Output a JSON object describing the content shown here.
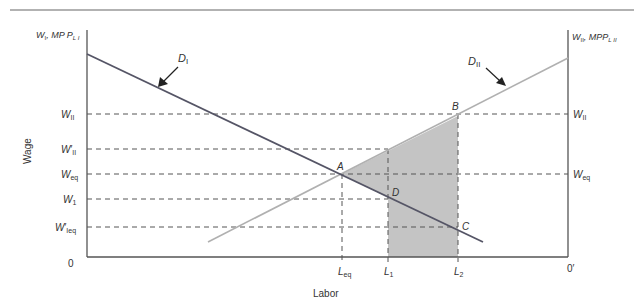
{
  "diagram": {
    "colors": {
      "axis": "#555555",
      "d1_line": "#555566",
      "d2_line": "#b0b0b0",
      "dashed": "#555555",
      "shaded": "#c4c4c4",
      "top_rule": "#666666"
    },
    "axes": {
      "y_label": "Wage",
      "x_label": "Labor",
      "left_axis_title": {
        "main": "W",
        "sub1": "I",
        "mid": ", MP P",
        "sub2": "L I"
      },
      "right_axis_title": {
        "main": "W",
        "sub1": "II",
        "mid": ", MPP",
        "sub2": "L II"
      },
      "origin_left": "0",
      "origin_right": "0′"
    },
    "curves": {
      "d1": {
        "label": "D",
        "sub": "I"
      },
      "d2": {
        "label": "D",
        "sub": "II"
      }
    },
    "left_ticks": [
      {
        "main": "W",
        "prime": "",
        "sub": "II"
      },
      {
        "main": "W",
        "prime": "′",
        "sub": "II"
      },
      {
        "main": "W",
        "prime": "",
        "sub": "eq"
      },
      {
        "main": "W",
        "prime": "",
        "sub": "1"
      },
      {
        "main": "W",
        "prime": "′",
        "sub": "Ieq"
      }
    ],
    "right_ticks": [
      {
        "main": "W",
        "sub": "II"
      },
      {
        "main": "W",
        "sub": "eq"
      }
    ],
    "x_ticks": [
      {
        "main": "L",
        "sub": "eq"
      },
      {
        "main": "L",
        "sub": "1"
      },
      {
        "main": "L",
        "sub": "2"
      }
    ],
    "points": {
      "a": "A",
      "b": "B",
      "c": "C",
      "d": "D"
    }
  }
}
